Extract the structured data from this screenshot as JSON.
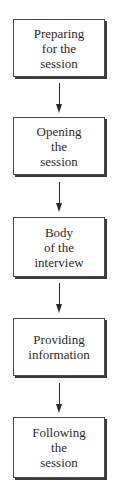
{
  "diagram": {
    "type": "flowchart",
    "direction": "top-to-bottom",
    "steps": [
      {
        "label": "Preparing\nfor the\nsession"
      },
      {
        "label": "Opening\nthe\nsession"
      },
      {
        "label": "Body\nof the\ninterview"
      },
      {
        "label": "Providing\ninformation"
      },
      {
        "label": "Following\nthe\nsession"
      }
    ],
    "connectors": [
      {
        "from": 0,
        "to": 1
      },
      {
        "from": 1,
        "to": 2
      },
      {
        "from": 2,
        "to": 3
      },
      {
        "from": 3,
        "to": 4
      }
    ],
    "colors": {
      "border": "#4a4a4a",
      "shadow": "#3a3a3a",
      "text": "#2a2a2a",
      "background": "#ffffff"
    }
  }
}
